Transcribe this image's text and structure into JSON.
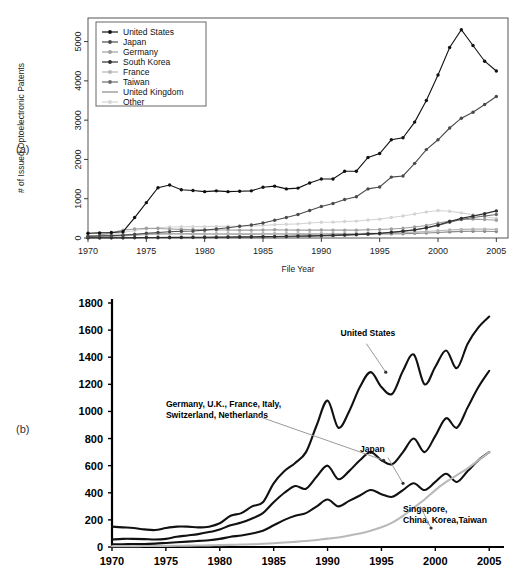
{
  "panels": {
    "a_label": "(a)",
    "b_label": "(b)"
  },
  "chart_data": [
    {
      "id": "panel-a",
      "type": "line",
      "title": "",
      "xlabel": "File Year",
      "ylabel": "# of Issued Optoelectronic Patents",
      "xlim": [
        1970,
        2006
      ],
      "ylim": [
        0,
        5600
      ],
      "xticks": [
        1970,
        1975,
        1980,
        1985,
        1990,
        1995,
        2000,
        2005
      ],
      "yticks": [
        0,
        1000,
        2000,
        3000,
        4000,
        5000
      ],
      "grid": false,
      "legend_position": "top-left",
      "markers": true,
      "x": [
        1970,
        1971,
        1972,
        1973,
        1974,
        1975,
        1976,
        1977,
        1978,
        1979,
        1980,
        1981,
        1982,
        1983,
        1984,
        1985,
        1986,
        1987,
        1988,
        1989,
        1990,
        1991,
        1992,
        1993,
        1994,
        1995,
        1996,
        1997,
        1998,
        1999,
        2000,
        2001,
        2002,
        2003,
        2004,
        2005
      ],
      "series": [
        {
          "name": "United States",
          "color": "#111111",
          "values": [
            120,
            130,
            140,
            160,
            520,
            900,
            1280,
            1350,
            1230,
            1210,
            1180,
            1200,
            1180,
            1190,
            1200,
            1290,
            1320,
            1250,
            1270,
            1400,
            1500,
            1500,
            1700,
            1700,
            2050,
            2150,
            2500,
            2550,
            2950,
            3500,
            4150,
            4850,
            5300,
            4900,
            4500,
            4250
          ]
        },
        {
          "name": "Japan",
          "color": "#4a4a4a",
          "values": [
            40,
            50,
            60,
            70,
            90,
            120,
            140,
            160,
            170,
            180,
            200,
            230,
            260,
            300,
            330,
            380,
            450,
            520,
            600,
            700,
            800,
            880,
            980,
            1050,
            1250,
            1300,
            1550,
            1580,
            1900,
            2250,
            2500,
            2800,
            3050,
            3200,
            3400,
            3600
          ]
        },
        {
          "name": "Germany",
          "color": "#9e9e9e",
          "values": [
            60,
            70,
            130,
            200,
            230,
            250,
            240,
            230,
            220,
            215,
            210,
            205,
            205,
            200,
            200,
            205,
            210,
            205,
            200,
            200,
            205,
            200,
            200,
            200,
            210,
            215,
            230,
            250,
            280,
            320,
            380,
            430,
            470,
            480,
            470,
            450
          ]
        },
        {
          "name": "South Korea",
          "color": "#2e2e2e",
          "values": [
            5,
            5,
            6,
            8,
            10,
            12,
            14,
            15,
            16,
            18,
            20,
            22,
            25,
            28,
            30,
            35,
            40,
            45,
            50,
            55,
            62,
            70,
            80,
            90,
            105,
            120,
            145,
            175,
            210,
            260,
            330,
            420,
            500,
            560,
            620,
            690
          ]
        },
        {
          "name": "France",
          "color": "#b5b5b5",
          "values": [
            25,
            30,
            40,
            55,
            70,
            85,
            95,
            100,
            100,
            100,
            100,
            100,
            100,
            100,
            100,
            105,
            110,
            110,
            110,
            110,
            115,
            115,
            115,
            115,
            120,
            120,
            130,
            140,
            150,
            165,
            185,
            205,
            220,
            225,
            225,
            220
          ]
        },
        {
          "name": "Taiwan",
          "color": "#6b6b6b",
          "values": [
            3,
            3,
            4,
            4,
            5,
            6,
            7,
            8,
            9,
            10,
            12,
            14,
            16,
            18,
            20,
            24,
            28,
            32,
            38,
            44,
            52,
            60,
            70,
            82,
            98,
            115,
            140,
            170,
            205,
            255,
            320,
            400,
            470,
            520,
            560,
            600
          ]
        },
        {
          "name": "United Kingdom",
          "color": "#8a8a8a",
          "values": [
            45,
            50,
            60,
            80,
            95,
            105,
            110,
            110,
            108,
            105,
            102,
            100,
            100,
            98,
            98,
            100,
            102,
            100,
            98,
            98,
            100,
            98,
            98,
            98,
            100,
            100,
            105,
            110,
            118,
            128,
            140,
            155,
            168,
            172,
            170,
            165
          ]
        },
        {
          "name": "Other",
          "color": "#d4d4d4",
          "values": [
            55,
            65,
            90,
            140,
            190,
            230,
            260,
            280,
            285,
            290,
            290,
            295,
            300,
            300,
            305,
            320,
            340,
            350,
            360,
            380,
            400,
            405,
            420,
            430,
            460,
            480,
            520,
            560,
            610,
            660,
            700,
            680,
            640,
            590,
            540,
            500
          ]
        }
      ]
    },
    {
      "id": "panel-b",
      "type": "line",
      "title": "",
      "xlabel": "",
      "ylabel": "",
      "xlim": [
        1970,
        2006
      ],
      "ylim": [
        0,
        1800
      ],
      "xticks": [
        1970,
        1975,
        1980,
        1985,
        1990,
        1995,
        2000,
        2005
      ],
      "yticks": [
        0,
        200,
        400,
        600,
        800,
        1000,
        1200,
        1400,
        1600,
        1800
      ],
      "grid": false,
      "legend_position": "inline-annotations",
      "markers": false,
      "annotations": [
        {
          "name": "united-states",
          "text": "United States",
          "x": 1991.2,
          "y": 1560
        },
        {
          "name": "europe-group",
          "text_lines": [
            "Germany, U.K., France, Italy,",
            "Switzerland, Netherlands"
          ],
          "x": 1975.0,
          "y": 1030
        },
        {
          "name": "japan",
          "text": "Japan",
          "x": 1993.0,
          "y": 700
        },
        {
          "name": "asia-group",
          "text_lines": [
            "Singapore,",
            "China, Korea,Taiwan"
          ],
          "x": 1997.0,
          "y": 255
        }
      ],
      "x": [
        1970,
        1971,
        1972,
        1973,
        1974,
        1975,
        1976,
        1977,
        1978,
        1979,
        1980,
        1981,
        1982,
        1983,
        1984,
        1985,
        1986,
        1987,
        1988,
        1989,
        1990,
        1991,
        1992,
        1993,
        1994,
        1995,
        1996,
        1997,
        1998,
        1999,
        2000,
        2001,
        2002,
        2003,
        2004,
        2005
      ],
      "series": [
        {
          "name": "United States",
          "color": "#111111",
          "values": [
            150,
            145,
            140,
            130,
            125,
            140,
            150,
            150,
            145,
            150,
            175,
            230,
            250,
            300,
            330,
            470,
            560,
            620,
            700,
            900,
            1080,
            880,
            1000,
            1180,
            1290,
            1180,
            1130,
            1300,
            1420,
            1200,
            1330,
            1450,
            1320,
            1500,
            1620,
            1700
          ]
        },
        {
          "name": "Germany, U.K., France, Italy, Switzerland, Netherlands",
          "color": "#111111",
          "values": [
            55,
            60,
            60,
            58,
            55,
            60,
            75,
            85,
            95,
            110,
            130,
            160,
            180,
            210,
            250,
            330,
            400,
            450,
            430,
            520,
            600,
            500,
            560,
            640,
            700,
            640,
            610,
            700,
            800,
            700,
            820,
            950,
            880,
            1030,
            1180,
            1300
          ]
        },
        {
          "name": "Japan",
          "color": "#111111",
          "values": [
            20,
            20,
            22,
            22,
            25,
            30,
            35,
            40,
            45,
            50,
            60,
            75,
            85,
            100,
            120,
            160,
            200,
            230,
            250,
            300,
            350,
            300,
            340,
            380,
            420,
            390,
            370,
            420,
            470,
            420,
            480,
            540,
            480,
            560,
            640,
            700
          ]
        },
        {
          "name": "Singapore, China, Korea, Taiwan",
          "color": "#b9b9b9",
          "values": [
            6,
            6,
            6,
            7,
            7,
            8,
            9,
            10,
            11,
            12,
            14,
            16,
            18,
            20,
            24,
            28,
            33,
            38,
            44,
            52,
            62,
            70,
            85,
            100,
            120,
            145,
            180,
            230,
            290,
            350,
            420,
            480,
            530,
            580,
            640,
            700
          ]
        }
      ]
    }
  ]
}
